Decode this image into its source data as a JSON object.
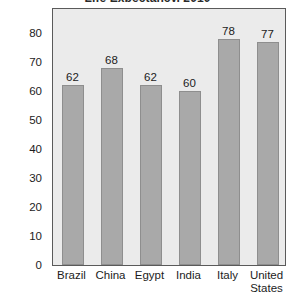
{
  "chart_data": {
    "type": "bar",
    "title": "Life Expectancy, 2010",
    "title_clipped": true,
    "xlabel": "",
    "ylabel": "",
    "categories": [
      "Brazil",
      "China",
      "Egypt",
      "India",
      "Italy",
      "United States"
    ],
    "values": [
      62,
      68,
      62,
      60,
      78,
      77
    ],
    "data_labels": [
      "62",
      "68",
      "62",
      "60",
      "78",
      "77"
    ],
    "yticks": [
      0,
      10,
      20,
      30,
      40,
      50,
      60,
      70,
      80
    ],
    "ytick_labels": [
      "0",
      "10",
      "20",
      "30",
      "40",
      "50",
      "60",
      "70",
      "80"
    ],
    "ylim": [
      0,
      89
    ],
    "grid": false,
    "legend": null,
    "colors": {
      "bar_fill": "#a9a9a9",
      "bar_edge": "#8e8e8e",
      "plot_background": "#ebebeb",
      "frame": "#5a5a5a",
      "text": "#1c1c1c",
      "page_background": "#ffffff"
    }
  }
}
